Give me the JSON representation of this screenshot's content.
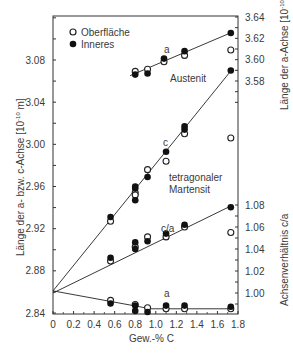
{
  "chart_data": {
    "type": "scatter",
    "title": "",
    "xlabel": "Gew.-% C",
    "ylabel_left": "Länge der a- bzw. c-Achse [10^-10 m]",
    "ylabel_right_top": "Länge der a-Achse [10^-10 m]",
    "ylabel_right_bottom": "Achsenverhältnis c/a",
    "xlim": [
      0,
      1.8
    ],
    "ylim_left": [
      2.84,
      3.12
    ],
    "ylim_right_top": [
      3.56,
      3.64
    ],
    "ylim_right_bottom": [
      0.99,
      1.08
    ],
    "x_ticks": [
      "0",
      "0.2",
      "0.4",
      "0.6",
      "0.8",
      "1.0",
      "1.2",
      "1.4",
      "1.6",
      "1.8"
    ],
    "y_left_ticks": [
      "2.84",
      "2.88",
      "2.92",
      "2.96",
      "3.00",
      "3.04",
      "3.08"
    ],
    "y_right_top_ticks": [
      "3.58",
      "3.60",
      "3.62",
      "3.64"
    ],
    "y_right_bottom_ticks": [
      "1.00",
      "1.02",
      "1.04",
      "1.06",
      "1.08"
    ],
    "legend": [
      {
        "label": "Oberfläche",
        "marker": "open-circle"
      },
      {
        "label": "Inneres",
        "marker": "filled-circle"
      }
    ],
    "legend_position": "upper-left",
    "grid": false,
    "annotations": [
      "a",
      "Austenit",
      "c",
      "tetragonaler",
      "Martensit",
      "c/a",
      "a"
    ],
    "series": [
      {
        "name": "Austenit a (Oberfläche)",
        "axis": "right_top",
        "marker": "open",
        "x": [
          0.8,
          0.92,
          1.08,
          1.28,
          1.73
        ],
        "y": [
          3.589,
          3.591,
          3.598,
          3.604,
          3.609
        ]
      },
      {
        "name": "Austenit a (Inneres)",
        "axis": "right_top",
        "marker": "filled",
        "x": [
          0.8,
          0.92,
          1.08,
          1.28,
          1.73
        ],
        "y": [
          3.586,
          3.587,
          3.601,
          3.608,
          3.625
        ]
      },
      {
        "name": "Martensit c (Oberfläche)",
        "axis": "left",
        "marker": "open",
        "x": [
          0.56,
          0.8,
          0.8,
          0.92,
          1.1,
          1.28,
          1.73
        ],
        "y": [
          2.927,
          2.954,
          2.952,
          2.976,
          2.984,
          3.01,
          3.006
        ]
      },
      {
        "name": "Martensit c (Inneres)",
        "axis": "left",
        "marker": "filled",
        "x": [
          0.56,
          0.8,
          0.8,
          0.8,
          0.92,
          1.1,
          1.28,
          1.28,
          1.73
        ],
        "y": [
          2.931,
          2.958,
          2.96,
          2.947,
          2.969,
          2.993,
          3.014,
          3.017,
          3.07
        ]
      },
      {
        "name": "Martensit c/a (Oberfläche)",
        "axis": "right_bottom",
        "marker": "open",
        "x": [
          0.56,
          0.8,
          0.92,
          1.1,
          1.28,
          1.73
        ],
        "y": [
          1.029,
          1.042,
          1.051,
          1.051,
          1.06,
          1.055
        ]
      },
      {
        "name": "Martensit c/a (Inneres)",
        "axis": "right_bottom",
        "marker": "filled",
        "x": [
          0.56,
          0.8,
          0.8,
          0.92,
          1.1,
          1.28,
          1.73
        ],
        "y": [
          1.032,
          1.046,
          1.04,
          1.047,
          1.054,
          1.062,
          1.078
        ]
      },
      {
        "name": "Martensit a (Oberfläche)",
        "axis": "left",
        "marker": "open",
        "x": [
          0.56,
          0.8,
          0.92,
          1.1,
          1.28,
          1.73
        ],
        "y": [
          2.852,
          2.848,
          2.845,
          2.844,
          2.844,
          2.844
        ]
      },
      {
        "name": "Martensit a (Inneres)",
        "axis": "left",
        "marker": "filled",
        "x": [
          0.56,
          0.8,
          0.8,
          0.92,
          1.1,
          1.28,
          1.73
        ],
        "y": [
          2.849,
          2.847,
          2.842,
          2.841,
          2.847,
          2.847,
          2.846
        ]
      }
    ],
    "fit_lines": [
      {
        "name": "Austenit a",
        "axis": "right_top",
        "x": [
          0.75,
          1.75
        ],
        "y": [
          3.585,
          3.626
        ]
      },
      {
        "name": "Martensit c",
        "axis": "left",
        "x": [
          0,
          1.75
        ],
        "y": [
          2.861,
          3.072
        ]
      },
      {
        "name": "Martensit c/a",
        "axis": "right_bottom",
        "x": [
          0,
          1.75
        ],
        "y": [
          1.0,
          1.08
        ]
      },
      {
        "name": "Martensit a",
        "axis": "left",
        "x": [
          0,
          0.95,
          1.75
        ],
        "y": [
          2.861,
          2.844,
          2.844
        ]
      }
    ]
  },
  "labels": {
    "legend_open": "Oberfläche",
    "legend_filled": "Inneres",
    "annot_a_top": "a",
    "annot_austenit": "Austenit",
    "annot_c": "c",
    "annot_tetragonaler": "tetragonaler",
    "annot_martensit": "Martensit",
    "annot_ca": "c/a",
    "annot_a_bottom": "a",
    "xlabel": "Gew.-% C",
    "ylabel_left": "Länge der a- bzw. c-Achse [10",
    "ylabel_left_exp": "-10",
    "ylabel_left_unit": " m]",
    "ylabel_right_top": "Länge der a-Achse [10",
    "ylabel_right_top_exp": "-10",
    "ylabel_right_top_unit": " m]",
    "ylabel_right_bottom": "Achsenverhältnis c/a"
  }
}
